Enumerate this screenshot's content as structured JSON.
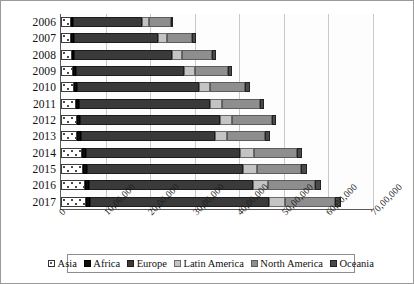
{
  "chart_data": {
    "type": "bar",
    "title": "",
    "subtitle": "",
    "xlabel": "",
    "ylabel": "",
    "orientation": "horizontal",
    "stacked": true,
    "grid": true,
    "legend_position": "bottom",
    "xlim": [
      0,
      7000000
    ],
    "xtick_labels": [
      "0",
      "10,00,000",
      "20,00,000",
      "30,00,000",
      "40,00,000",
      "50,00,000",
      "60,00,000",
      "70,00,000"
    ],
    "xtick_values": [
      0,
      1000000,
      2000000,
      3000000,
      4000000,
      5000000,
      6000000,
      7000000
    ],
    "categories": [
      "2006",
      "2007",
      "2008",
      "2009",
      "2010",
      "2011",
      "2012",
      "2013",
      "2014",
      "2015",
      "2016",
      "2017"
    ],
    "series": [
      {
        "name": "Asia",
        "color": "#ffffff",
        "values": [
          220000,
          230000,
          240000,
          265000,
          300000,
          330000,
          355000,
          360000,
          470000,
          500000,
          530000,
          550000
        ]
      },
      {
        "name": "Africa",
        "color": "#0d0d0d",
        "values": [
          60000,
          60000,
          62000,
          65000,
          70000,
          72000,
          80000,
          78000,
          90000,
          92000,
          95000,
          98000
        ]
      },
      {
        "name": "Europe",
        "color": "#3a3a3a",
        "values": [
          1530000,
          1880000,
          2180000,
          2440000,
          2720000,
          2950000,
          3130000,
          3020000,
          3460000,
          3490000,
          3680000,
          4030000
        ]
      },
      {
        "name": "Latin America",
        "color": "#c4c4c4",
        "values": [
          160000,
          200000,
          230000,
          245000,
          260000,
          270000,
          280000,
          275000,
          310000,
          320000,
          330000,
          345000
        ]
      },
      {
        "name": "North America",
        "color": "#8e8e8e",
        "values": [
          490000,
          580000,
          680000,
          740000,
          790000,
          840000,
          880000,
          850000,
          960000,
          990000,
          1060000,
          1130000
        ]
      },
      {
        "name": "Oceania",
        "color": "#4a4a4a",
        "values": [
          60000,
          75000,
          85000,
          90000,
          95000,
          100000,
          105000,
          100000,
          115000,
          120000,
          130000,
          140000
        ]
      }
    ],
    "totals": [
      2520000,
      3025000,
      3477000,
      3845000,
      4235000,
      4562000,
      4830000,
      4683000,
      5405000,
      5512000,
      5825000,
      6293000
    ]
  },
  "legend": {
    "items": [
      {
        "label": "Asia",
        "key": "asia"
      },
      {
        "label": "Africa",
        "key": "africa"
      },
      {
        "label": "Europe",
        "key": "europe"
      },
      {
        "label": "Latin America",
        "key": "latin"
      },
      {
        "label": "North America",
        "key": "north"
      },
      {
        "label": "Oceania",
        "key": "oceania"
      }
    ]
  }
}
